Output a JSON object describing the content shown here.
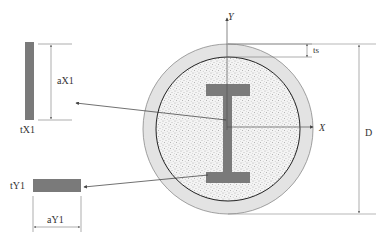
{
  "diagram": {
    "type": "cross-section",
    "labels": {
      "axis_y": "Y",
      "axis_x": "X",
      "tube_thickness": "ts",
      "diameter": "D",
      "flange_plate_length": "aX1",
      "flange_plate_thickness": "tX1",
      "web_plate_thickness": "tY1",
      "web_plate_length": "aY1"
    },
    "caption": "",
    "colors": {
      "steel": "#7a7a7a",
      "tube": "#e2e2e2",
      "concrete": "#f2f2f2",
      "lines": "#555555"
    }
  }
}
